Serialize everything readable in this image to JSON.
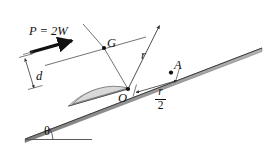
{
  "figure": {
    "background": "#ffffff",
    "width": 267,
    "height": 152
  },
  "labels": {
    "force": "P = 2W",
    "moment_arm": "d",
    "centroid": "G",
    "radius": "r",
    "point_a": "A",
    "contact_point": "O",
    "incline_angle": "θ",
    "half_radius_numerator": "r",
    "half_radius_denominator": "2"
  },
  "colors": {
    "outline": "#3a3a3a",
    "body_fill": "#d9d9d9",
    "rim_fill": "#ececec",
    "incline_fill": "#8f8f8f",
    "text": "#111111",
    "force_arrow": "#111111",
    "thin_line": "#555555"
  },
  "geometry": {
    "incline_angle_degrees": 21,
    "contact_point": {
      "x": 128,
      "y": 89
    },
    "centroid_point": {
      "x": 104,
      "y": 48
    },
    "point_a": {
      "x": 171,
      "y": 73
    },
    "radius_tip": {
      "x": 160,
      "y": 25
    },
    "semicircle_radius": 62,
    "force_arrow_start": {
      "x": 30,
      "y": 52
    },
    "force_arrow_end": {
      "x": 73,
      "y": 40
    },
    "angle_vertex": {
      "x": 29,
      "y": 138
    }
  },
  "icons": {
    "force_arrow": "arrow-right-bold-icon",
    "radius_arrow": "arrow-line-icon",
    "dimension_arrow": "double-headed-arrow-icon",
    "angle_arc": "arc-icon"
  }
}
